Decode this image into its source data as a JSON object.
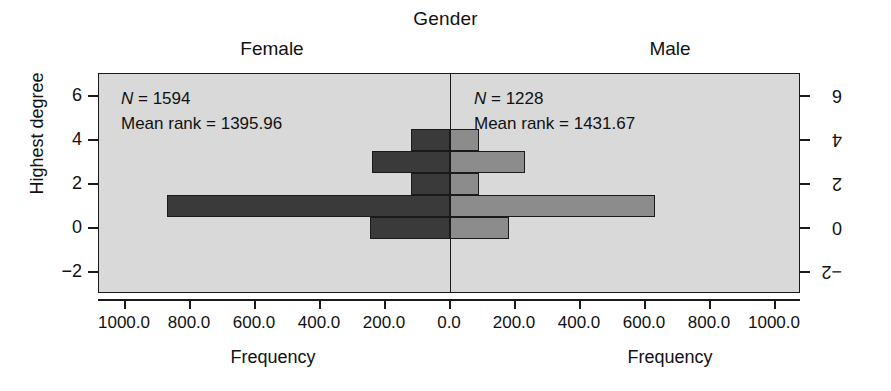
{
  "title": "Gender",
  "panels": {
    "left": {
      "label": "Female",
      "n_text": "N = 1594",
      "mean_rank_text": "Mean rank = 1395.96",
      "n_symbol": "N",
      "n_value": " = 1594",
      "x_axis_title": "Frequency",
      "y_axis_title": "Highest degree"
    },
    "right": {
      "label": "Male",
      "n_text": "N = 1228",
      "mean_rank_text": "Mean rank = 1431.67",
      "n_symbol": "N",
      "n_value": " = 1228",
      "x_axis_title": "Frequency",
      "y_axis_title": "Highest degree"
    }
  },
  "colors": {
    "panel_background": "#d9d9d9",
    "female_bar": "#3a3a3a",
    "male_bar": "#8c8c8c",
    "axis": "#1a1a1a",
    "page_background": "#ffffff"
  },
  "chart_data": {
    "type": "bar",
    "subtype": "back-to-back population pyramid histogram",
    "title": "Gender",
    "xlabel": "Frequency",
    "ylabel": "Highest degree",
    "grid": false,
    "legend_position": "none",
    "orientation": "horizontal",
    "categories": [
      -2,
      0,
      1,
      2,
      3,
      4,
      5,
      6
    ],
    "y_tick_labels": [
      "6",
      "4",
      "2",
      "0",
      "−2"
    ],
    "y_tick_values": [
      6,
      4,
      2,
      0,
      -2
    ],
    "ylim": [
      -3,
      7
    ],
    "x_tick_labels_left": [
      "1000.0",
      "800.0",
      "600.0",
      "400.0",
      "200.0",
      "0.0"
    ],
    "x_tick_values_left": [
      1000,
      800,
      600,
      400,
      200,
      0
    ],
    "x_tick_labels_right": [
      "0.0",
      "200.0",
      "400.0",
      "600.0",
      "800.0",
      "1000.0"
    ],
    "x_tick_values_right": [
      0,
      200,
      400,
      600,
      800,
      1000
    ],
    "xlim": [
      0,
      1080
    ],
    "series": [
      {
        "name": "Female",
        "direction": "left",
        "color": "#3a3a3a",
        "n": 1594,
        "mean_rank": 1395.96,
        "bars": [
          {
            "degree": 0,
            "value": 245
          },
          {
            "degree": 1,
            "value": 870
          },
          {
            "degree": 2,
            "value": 120
          },
          {
            "degree": 3,
            "value": 240
          },
          {
            "degree": 4,
            "value": 120
          }
        ]
      },
      {
        "name": "Male",
        "direction": "right",
        "color": "#8c8c8c",
        "n": 1228,
        "mean_rank": 1431.67,
        "bars": [
          {
            "degree": 0,
            "value": 180
          },
          {
            "degree": 1,
            "value": 630
          },
          {
            "degree": 2,
            "value": 90
          },
          {
            "degree": 3,
            "value": 230
          },
          {
            "degree": 4,
            "value": 90
          }
        ]
      }
    ]
  }
}
